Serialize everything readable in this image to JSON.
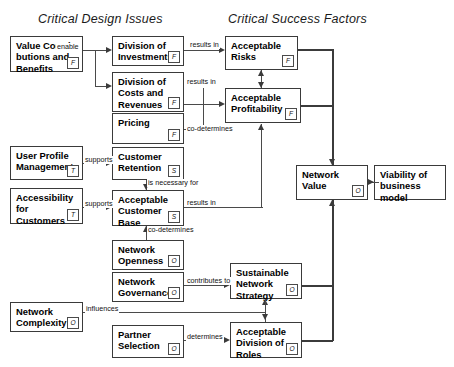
{
  "diagram": {
    "headers": [
      {
        "id": "design-issues",
        "label": "Critical Design Issues"
      },
      {
        "id": "success-factors",
        "label": "Critical Success Factors"
      }
    ],
    "marker_legend": {
      "F": "F",
      "S": "S",
      "T": "T",
      "O": "O"
    },
    "nodes": [
      {
        "id": "value-contributions",
        "lines": [
          "Value Contri-",
          "butions and",
          "Benefits"
        ],
        "marker": "F"
      },
      {
        "id": "division-investments",
        "lines": [
          "Division of",
          "Investments"
        ],
        "marker": "F"
      },
      {
        "id": "division-costs-revenues",
        "lines": [
          "Division of",
          "Costs and",
          "Revenues"
        ],
        "marker": "F"
      },
      {
        "id": "pricing",
        "lines": [
          "Pricing"
        ],
        "marker": "F"
      },
      {
        "id": "acceptable-risks",
        "lines": [
          "Acceptable",
          "Risks"
        ],
        "marker": "F"
      },
      {
        "id": "acceptable-profitability",
        "lines": [
          "Acceptable",
          "Profitability"
        ],
        "marker": "F"
      },
      {
        "id": "user-profile-management",
        "lines": [
          "User Profile",
          "Management"
        ],
        "marker": "T"
      },
      {
        "id": "accessibility-customers",
        "lines": [
          "Accessibility",
          "for",
          "Customers"
        ],
        "marker": "T"
      },
      {
        "id": "customer-retention",
        "lines": [
          "Customer",
          "Retention"
        ],
        "marker": "S"
      },
      {
        "id": "acceptable-customer-base",
        "lines": [
          "Acceptable",
          "Customer",
          "Base"
        ],
        "marker": "S"
      },
      {
        "id": "network-openness",
        "lines": [
          "Network",
          "Openness"
        ],
        "marker": "O"
      },
      {
        "id": "network-governance",
        "lines": [
          "Network",
          "Governance"
        ],
        "marker": "O"
      },
      {
        "id": "network-complexity",
        "lines": [
          "Network",
          "Complexity"
        ],
        "marker": "O"
      },
      {
        "id": "partner-selection",
        "lines": [
          "Partner",
          "Selection"
        ],
        "marker": "O"
      },
      {
        "id": "sustainable-network-strategy",
        "lines": [
          "Sustainable",
          "Network",
          "Strategy"
        ],
        "marker": "O"
      },
      {
        "id": "acceptable-division-roles",
        "lines": [
          "Acceptable",
          "Division of",
          "Roles"
        ],
        "marker": "O"
      },
      {
        "id": "network-value",
        "lines": [
          "Network",
          "Value"
        ],
        "marker": "O"
      },
      {
        "id": "viability-business-model",
        "lines": [
          "Viability of",
          "business model"
        ],
        "marker": ""
      }
    ],
    "edges": [
      {
        "id": "enable",
        "label": "enable",
        "from": "value-contributions",
        "to": "division-investments"
      },
      {
        "id": "enable-2",
        "label": "",
        "from": "value-contributions",
        "to": "division-costs-revenues"
      },
      {
        "id": "results-in-risks",
        "label": "results in",
        "from": "division-investments",
        "to": "acceptable-risks"
      },
      {
        "id": "results-in-profitability",
        "label": "results in",
        "from": "division-costs-revenues",
        "to": "acceptable-profitability"
      },
      {
        "id": "co-determines-profitability",
        "label": "co-determines",
        "from": "pricing",
        "to": "acceptable-profitability"
      },
      {
        "id": "risks-profitability",
        "label": "",
        "from": "acceptable-risks",
        "to": "acceptable-profitability"
      },
      {
        "id": "supports-retention",
        "label": "supports",
        "from": "user-profile-management",
        "to": "customer-retention"
      },
      {
        "id": "supports-customer-base",
        "label": "supports",
        "from": "accessibility-customers",
        "to": "acceptable-customer-base"
      },
      {
        "id": "is-necessary-for",
        "label": "is necessary for",
        "from": "customer-retention",
        "to": "acceptable-customer-base"
      },
      {
        "id": "results-in-profitability-2",
        "label": "results in",
        "from": "acceptable-customer-base",
        "to": "acceptable-profitability"
      },
      {
        "id": "co-determines-customer-base",
        "label": "co-determines",
        "from": "network-openness",
        "to": "acceptable-customer-base"
      },
      {
        "id": "contributes-to",
        "label": "contributes to",
        "from": "network-governance",
        "to": "sustainable-network-strategy"
      },
      {
        "id": "influences",
        "label": "influences",
        "from": "network-complexity",
        "to": "sustainable-network-strategy"
      },
      {
        "id": "determines",
        "label": "determines",
        "from": "partner-selection",
        "to": "acceptable-division-roles"
      },
      {
        "id": "roles-strategy",
        "label": "",
        "from": "acceptable-division-roles",
        "to": "sustainable-network-strategy"
      },
      {
        "id": "risks-to-value",
        "label": "",
        "from": "acceptable-risks",
        "to": "network-value"
      },
      {
        "id": "profitability-to-value",
        "label": "",
        "from": "acceptable-profitability",
        "to": "network-value"
      },
      {
        "id": "strategy-to-value",
        "label": "",
        "from": "sustainable-network-strategy",
        "to": "network-value"
      },
      {
        "id": "roles-to-value",
        "label": "",
        "from": "acceptable-division-roles",
        "to": "network-value"
      },
      {
        "id": "value-to-viability",
        "label": "",
        "from": "network-value",
        "to": "viability-business-model"
      }
    ]
  }
}
